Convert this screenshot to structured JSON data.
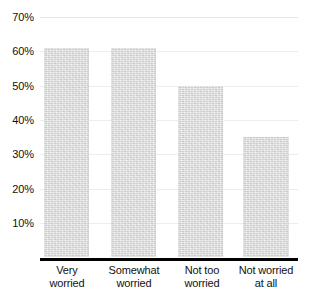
{
  "chart_data": {
    "type": "bar",
    "title": "",
    "subtitle": "",
    "xlabel": "",
    "ylabel": "",
    "categories": [
      "Very worried",
      "Somewhat worried",
      "Not too worried",
      "Not worried at all"
    ],
    "category_lines": [
      [
        "Very",
        "worried"
      ],
      [
        "Somewhat",
        "worried"
      ],
      [
        "Not too",
        "worried"
      ],
      [
        "Not worried",
        "at all"
      ]
    ],
    "values": [
      61,
      61,
      50,
      35
    ],
    "value_labels": [
      "61%",
      "61%",
      "50%",
      "35%"
    ],
    "ylim": [
      0,
      70
    ],
    "ytick_values": [
      70,
      60,
      50,
      40,
      30,
      20,
      10
    ],
    "ytick_labels": [
      "70%",
      "60%",
      "50%",
      "40%",
      "30%",
      "20%",
      "10%"
    ],
    "grid": true,
    "grid_axis": "y",
    "legend": null,
    "legend_position": "none",
    "annotations": []
  },
  "style": {
    "bar_fill": "#d9d9d9",
    "gridline_color": "#ededed",
    "axis_color": "#000000",
    "text_color": "#111111",
    "background": "#ffffff"
  },
  "footnote": {
    "text": ""
  }
}
